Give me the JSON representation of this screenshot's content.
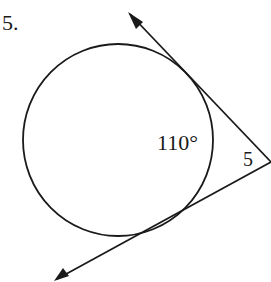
{
  "problem_number": "5.",
  "arc_label": "110°",
  "angle_label": "5",
  "colors": {
    "stroke": "#1a1a1a",
    "background": "#ffffff"
  }
}
